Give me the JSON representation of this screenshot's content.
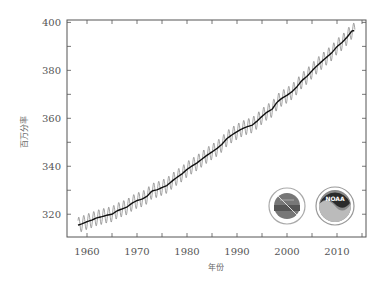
{
  "chart_data": {
    "type": "line",
    "title": "",
    "xlabel": "年份",
    "ylabel": "百万分率",
    "xlim": [
      1956,
      2015.8
    ],
    "ylim": [
      310.5,
      401
    ],
    "x_ticks": [
      1960,
      1970,
      1980,
      1990,
      2000,
      2010
    ],
    "y_ticks": [
      320,
      340,
      360,
      380,
      400
    ],
    "grid": false,
    "legend": null,
    "series": [
      {
        "name": "年平均值(趋势)",
        "style": "smooth-black",
        "x": [
          1958,
          1959,
          1960,
          1961,
          1962,
          1963,
          1964,
          1965,
          1966,
          1967,
          1968,
          1969,
          1970,
          1971,
          1972,
          1973,
          1974,
          1975,
          1976,
          1977,
          1978,
          1979,
          1980,
          1981,
          1982,
          1983,
          1984,
          1985,
          1986,
          1987,
          1988,
          1989,
          1990,
          1991,
          1992,
          1993,
          1994,
          1995,
          1996,
          1997,
          1998,
          1999,
          2000,
          2001,
          2002,
          2003,
          2004,
          2005,
          2006,
          2007,
          2008,
          2009,
          2010,
          2011,
          2012,
          2013
        ],
        "values": [
          315.3,
          316.0,
          316.9,
          317.6,
          318.5,
          319.0,
          319.6,
          320.0,
          321.4,
          322.2,
          323.0,
          324.6,
          325.7,
          326.3,
          327.5,
          329.7,
          330.2,
          331.1,
          332.0,
          333.8,
          335.4,
          336.8,
          338.7,
          340.1,
          341.4,
          343.0,
          344.6,
          346.0,
          347.4,
          349.2,
          351.6,
          353.1,
          354.4,
          355.6,
          356.5,
          357.1,
          358.8,
          360.8,
          362.6,
          363.7,
          366.7,
          368.4,
          369.6,
          371.1,
          373.2,
          375.8,
          377.5,
          379.8,
          381.9,
          383.8,
          385.6,
          387.4,
          389.9,
          391.6,
          393.8,
          396.5
        ]
      },
      {
        "name": "月平均值(季节变化)",
        "style": "thin-gray-oscillating",
        "seasonal_amplitude_ppm": 3.2
      }
    ]
  },
  "logos": [
    {
      "name": "NOAA Scripps/ESRL seal",
      "label": ""
    },
    {
      "name": "NOAA logo",
      "label": "NOAA"
    }
  ]
}
